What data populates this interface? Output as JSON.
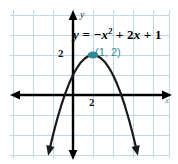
{
  "figure": {
    "kind": "coordinate-plane-graph",
    "background_color": "#ffffff"
  },
  "labels": {
    "equation_lead": "y",
    "equation_eq": "=",
    "equation_neg_x": "−x",
    "equation_exponent": "2",
    "equation_plus_one": "+ 2",
    "equation_x": "x",
    "equation_plus_two": "+ 1",
    "equation_full": "y = −x² + 2x + 1",
    "vertex_point": "(1, 2)",
    "y_tick": "2",
    "x_tick": "2",
    "y_axis": "y",
    "x_axis": "x"
  },
  "colors": {
    "grid": "#bdd9e7",
    "axis": "#000000",
    "curve": "#1a1a1a",
    "vertex": "#2e8a96",
    "vertex_text": "#2e8a96",
    "tick_text": "#111111",
    "equation_text": "#000000"
  },
  "chart_data": {
    "type": "line",
    "title": "",
    "subtitle": "",
    "xlabel": "x",
    "ylabel": "y",
    "equation": "y = -x^2 + 2x + 1",
    "function": "quadratic",
    "coefficients": {
      "a": -1,
      "b": 2,
      "c": 1
    },
    "vertex": {
      "x": 1,
      "y": 2,
      "label": "(1, 2)"
    },
    "axis_of_symmetry": 1,
    "y_intercept": 1,
    "x_intercepts": [
      -0.414,
      2.414
    ],
    "opens": "down",
    "xlim": [
      -3.15,
      4.85
    ],
    "ylim": [
      -4.25,
      3.4
    ],
    "grid": true,
    "grid_step": 1,
    "legend": "none",
    "tick_labels": {
      "x": [
        2
      ],
      "y": [
        2
      ]
    },
    "annotations": [
      {
        "text": "y = −x² + 2x + 1",
        "x": 0.05,
        "y": 3.0
      },
      {
        "text": "(1, 2)",
        "x": 1.25,
        "y": 2.45
      }
    ],
    "x": [
      -2.2,
      -2.0,
      -1.8,
      -1.6,
      -1.4,
      -1.2,
      -1.0,
      -0.8,
      -0.6,
      -0.4,
      -0.2,
      0.0,
      0.2,
      0.4,
      0.6,
      0.8,
      1.0,
      1.2,
      1.4,
      1.6,
      1.8,
      2.0,
      2.2,
      2.4,
      2.6,
      2.8,
      3.0,
      3.2,
      3.4,
      3.6,
      3.8,
      4.0,
      4.2
    ],
    "values": [
      -8.24,
      -7.0,
      -5.84,
      -4.76,
      -3.76,
      -2.84,
      -2.0,
      -1.24,
      -0.56,
      0.04,
      0.56,
      1.0,
      1.36,
      1.64,
      1.84,
      1.96,
      2.0,
      1.96,
      1.84,
      1.64,
      1.36,
      1.0,
      0.56,
      0.04,
      -0.56,
      -1.24,
      -2.0,
      -2.84,
      -3.76,
      -4.76,
      -5.84,
      -7.0,
      -8.24
    ]
  }
}
